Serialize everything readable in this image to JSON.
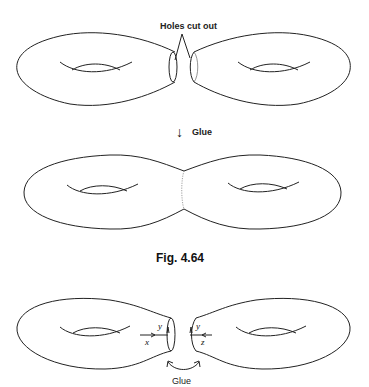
{
  "diagram": {
    "top": {
      "label": "Holes cut out"
    },
    "middle": {
      "arrow": "↓",
      "label": "Glue"
    },
    "caption": "Fig. 4.64",
    "bottom": {
      "left_labels": {
        "vertical": "y",
        "horizontal": "x"
      },
      "right_labels": {
        "vertical": "y",
        "horizontal": "z"
      },
      "glue_label": "Glue"
    }
  }
}
